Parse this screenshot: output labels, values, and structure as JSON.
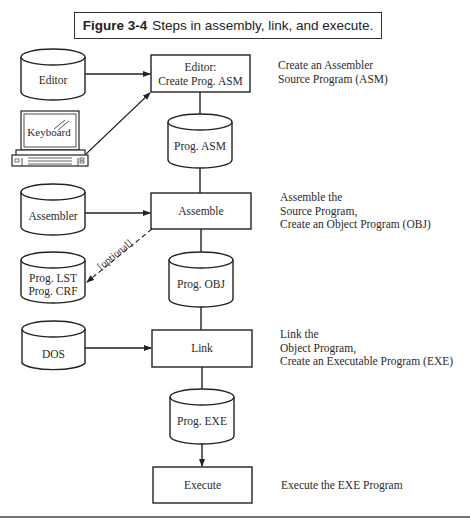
{
  "figure": {
    "number": "Figure 3-4",
    "caption": "Steps in assembly, link, and execute."
  },
  "inputs": {
    "editor": "Editor",
    "keyboard": "Keyboard",
    "assembler": "Assembler",
    "listing_line1": "Prog. LST",
    "listing_line2": "Prog. CRF",
    "dos": "DOS"
  },
  "process_steps": [
    {
      "line1": "Editor:",
      "line2": "Create Prog. ASM"
    },
    {
      "line1": "Assemble"
    },
    {
      "line1": "Link"
    },
    {
      "line1": "Execute"
    }
  ],
  "files": {
    "asm": "Prog. ASM",
    "obj": "Prog. OBJ",
    "exe": "Prog. EXE"
  },
  "optional_label": "[optional]",
  "descriptions": [
    {
      "lines": [
        "Create an Assembler",
        "Source Program (ASM)"
      ]
    },
    {
      "lines": [
        "Assemble the",
        "Source Program,",
        "Create an Object Program (OBJ)"
      ]
    },
    {
      "lines": [
        "Link the",
        "Object Program,",
        "Create an Executable Program (EXE)"
      ]
    },
    {
      "lines": [
        "Execute the EXE Program"
      ]
    }
  ],
  "colors": {
    "stroke": "#222222",
    "text": "#2a2a2a",
    "background": "#ffffff"
  }
}
